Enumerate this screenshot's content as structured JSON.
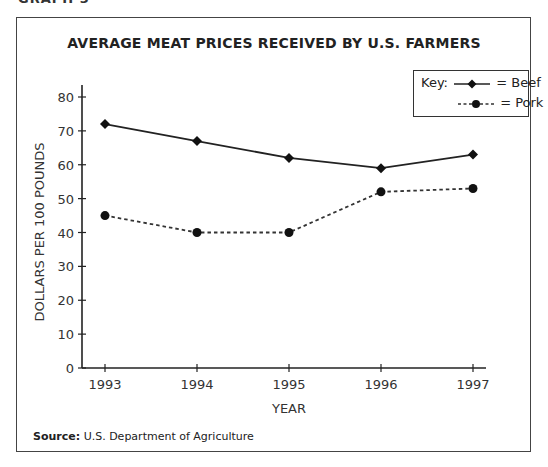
{
  "page": {
    "graph_label": "GRAPH 3",
    "source_label": "Source:",
    "source_text": "U.S. Department of Agriculture"
  },
  "chart_data": {
    "type": "line",
    "title": "AVERAGE MEAT PRICES RECEIVED BY U.S. FARMERS",
    "xlabel": "YEAR",
    "ylabel": "DOLLARS PER 100 POUNDS",
    "categories": [
      "1993",
      "1994",
      "1995",
      "1996",
      "1997"
    ],
    "yticks": [
      0,
      10,
      20,
      30,
      40,
      50,
      60,
      70,
      80
    ],
    "ylim": [
      0,
      80
    ],
    "grid": false,
    "legend_position": "top-right",
    "legend_title": "Key:",
    "series": [
      {
        "name": "Beef",
        "legend_text": "= Beef",
        "style": "solid",
        "marker": "diamond",
        "values": [
          72,
          67,
          62,
          59,
          63
        ]
      },
      {
        "name": "Pork",
        "legend_text": "= Pork",
        "style": "dashed",
        "marker": "circle",
        "values": [
          45,
          40,
          40,
          52,
          53
        ]
      }
    ]
  }
}
